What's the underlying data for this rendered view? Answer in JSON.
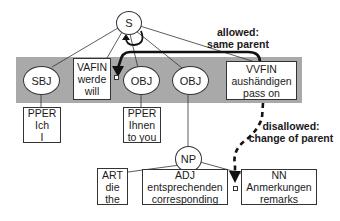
{
  "diagram": {
    "root": {
      "label": "S"
    },
    "constituents": [
      {
        "id": "sbj",
        "label": "SBJ",
        "shape": "ellipse"
      },
      {
        "id": "vafin",
        "shape": "box",
        "lines": [
          "VAFIN",
          "werde",
          "will"
        ]
      },
      {
        "id": "obj1",
        "label": "OBJ",
        "shape": "ellipse"
      },
      {
        "id": "obj2",
        "label": "OBJ",
        "shape": "ellipse"
      },
      {
        "id": "vvfin",
        "shape": "box",
        "lines": [
          "VVFIN",
          "aushändigen",
          "pass on"
        ]
      }
    ],
    "leaves": [
      {
        "id": "pper1",
        "lines": [
          "PPER",
          "Ich",
          "I"
        ]
      },
      {
        "id": "pper2",
        "lines": [
          "PPER",
          "Ihnen",
          "to you"
        ]
      }
    ],
    "np": {
      "label": "NP"
    },
    "np_children": [
      {
        "id": "art",
        "lines": [
          "ART",
          "die",
          "the"
        ]
      },
      {
        "id": "adj",
        "lines": [
          "ADJ",
          "entsprechenden",
          "corresponding"
        ]
      },
      {
        "id": "nn",
        "lines": [
          "NN",
          "Anmerkungen",
          "remarks"
        ]
      }
    ],
    "annotations": {
      "allowed": [
        "allowed:",
        "same parent"
      ],
      "disallowed": [
        "disallowed:",
        "change of parent"
      ]
    },
    "colors": {
      "band": "#a9a9a9",
      "line": "#333333",
      "arrow": "#111111"
    }
  }
}
